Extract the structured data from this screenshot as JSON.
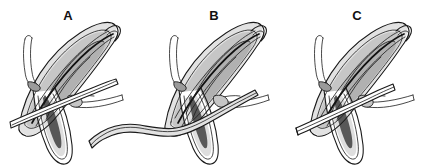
{
  "figure": {
    "kind": "multi-panel-line-illustration",
    "background_color": "#ffffff",
    "width": 442,
    "height": 167,
    "ink_color": "#1a1a1a",
    "panels": [
      {
        "id": "A",
        "label": "A",
        "label_x": 68,
        "label_y": 17,
        "description": "Elongated pointed structure shown in section with straight instrument shaft entering from the lower left and a fine wire hook at the upper left; a second fine probe exits to the right."
      },
      {
        "id": "B",
        "label": "B",
        "label_x": 214,
        "label_y": 17,
        "description": "Same structure with the instrument shaft extended and bent, curving away across the bottom of the panel toward the left."
      },
      {
        "id": "C",
        "label": "C",
        "label_x": 357,
        "label_y": 17,
        "description": "Same structure with the straight instrument shaft withdrawn to the left, terminating in a blunt cut end."
      }
    ],
    "tones": {
      "paper": "#ffffff",
      "light_gray": "#e2e2e2",
      "mid_gray": "#c6c6c6",
      "dark_gray_shade": "#9a9a9a",
      "deep_gray_wedge": "#585858",
      "outline": "#1a1a1a"
    }
  }
}
